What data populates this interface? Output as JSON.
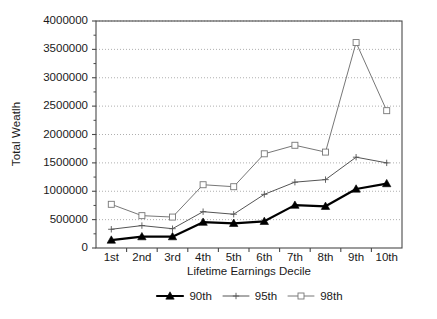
{
  "chart_data": {
    "type": "line",
    "title": "",
    "xlabel": "Lifetime Earnings Decile",
    "ylabel": "Total Weatlh",
    "categories": [
      "1st",
      "2nd",
      "3rd",
      "4th",
      "5th",
      "6th",
      "7th",
      "8th",
      "9th",
      "10th"
    ],
    "ylim": [
      0,
      4000000
    ],
    "yticks": [
      0,
      500000,
      1000000,
      1500000,
      2000000,
      2500000,
      3000000,
      3500000,
      4000000
    ],
    "ytick_labels": [
      "0",
      "500000",
      "1000000",
      "1500000",
      "2000000",
      "2500000",
      "3000000",
      "3500000",
      "4000000"
    ],
    "grid": true,
    "grid_style": "dotted",
    "legend_position": "bottom",
    "series": [
      {
        "name": "90th",
        "marker": "filled-triangle",
        "color": "#000000",
        "line_width": 2.2,
        "values": [
          140000,
          200000,
          200000,
          455000,
          435000,
          470000,
          755000,
          735000,
          1040000,
          1135000
        ]
      },
      {
        "name": "95th",
        "marker": "plus",
        "color": "#555555",
        "line_width": 1,
        "values": [
          330000,
          395000,
          340000,
          640000,
          595000,
          945000,
          1160000,
          1205000,
          1600000,
          1500000
        ]
      },
      {
        "name": "98th",
        "marker": "open-square",
        "color": "#777777",
        "line_width": 1,
        "values": [
          770000,
          570000,
          545000,
          1115000,
          1080000,
          1660000,
          1810000,
          1690000,
          3620000,
          2420000
        ]
      }
    ]
  },
  "legend": {
    "items": [
      {
        "label": "90th"
      },
      {
        "label": "95th"
      },
      {
        "label": "98th"
      }
    ]
  }
}
